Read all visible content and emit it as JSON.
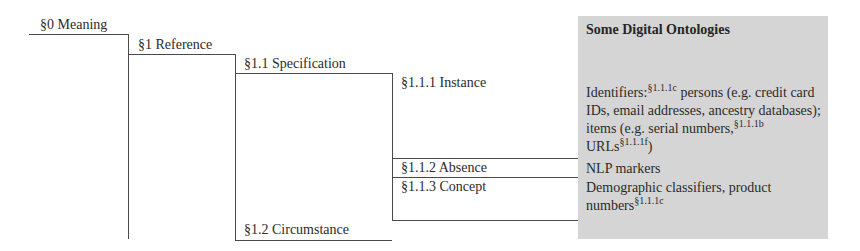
{
  "diagram": {
    "nodes": [
      {
        "id": "s0",
        "label": "§0 Meaning"
      },
      {
        "id": "s1",
        "label": "§1 Reference"
      },
      {
        "id": "s1_1",
        "label": "§1.1 Specification"
      },
      {
        "id": "s1_1_1",
        "label": "§1.1.1 Instance"
      },
      {
        "id": "s1_1_2",
        "label": "§1.1.2 Absence"
      },
      {
        "id": "s1_1_3",
        "label": "§1.1.3 Concept"
      },
      {
        "id": "s1_2",
        "label": "§1.2 Circumstance"
      }
    ],
    "edges": [
      {
        "from": "s0",
        "to": "s1"
      },
      {
        "from": "s1",
        "to": "s1_1"
      },
      {
        "from": "s1",
        "to": "s1_2"
      },
      {
        "from": "s1_1",
        "to": "s1_1_1"
      },
      {
        "from": "s1_1",
        "to": "s1_1_2"
      },
      {
        "from": "s1_1",
        "to": "s1_1_3"
      }
    ]
  },
  "panel": {
    "title": "Some Digital Ontologies",
    "background": "#d5d5d5",
    "instance": {
      "p1": "Identifiers:",
      "sup1": "§1.1.1c",
      "p2": " persons (e.g. credit card IDs, email addresses, ancestry databases); items (e.g. serial numbers,",
      "sup2": "§1.1.1b",
      "p3": " URLs",
      "sup3": "§1.1.1f",
      "p4": ")"
    },
    "absence": "NLP markers",
    "concept": {
      "p1": "Demographic classifiers, product numbers",
      "sup1": "§1.1.1c"
    }
  }
}
